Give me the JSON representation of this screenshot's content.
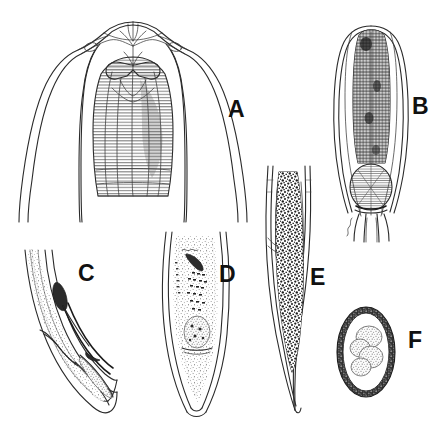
{
  "figure": {
    "kind": "scientific-line-drawing-plate",
    "background_color": "#ffffff",
    "ink_color": "#2a2a2a",
    "label_color": "#111111",
    "width": 445,
    "height": 437,
    "panel_count": 6
  },
  "panels": [
    {
      "id": "A",
      "label": "A",
      "label_x": 228,
      "label_y": 98,
      "description": "anterior end, en face / lateral view showing cephalic alae and striated esophagus",
      "box": {
        "x": 20,
        "y": 12,
        "width": 215,
        "height": 215
      }
    },
    {
      "id": "B",
      "label": "B",
      "label_x": 412,
      "label_y": 95,
      "description": "anterior end showing esophagus and terminal esophageal bulb",
      "box": {
        "x": 330,
        "y": 20,
        "width": 100,
        "height": 220
      }
    },
    {
      "id": "C",
      "label": "C",
      "label_x": 78,
      "label_y": 262,
      "description": "curved male tail with spicule",
      "box": {
        "x": 22,
        "y": 248,
        "width": 95,
        "height": 160
      }
    },
    {
      "id": "D",
      "label": "D",
      "label_x": 219,
      "label_y": 263,
      "description": "tail region, lateral view",
      "box": {
        "x": 158,
        "y": 228,
        "width": 90,
        "height": 185
      }
    },
    {
      "id": "E",
      "label": "E",
      "label_x": 310,
      "label_y": 266,
      "description": "pointed tail with granular intestinal contents",
      "box": {
        "x": 262,
        "y": 162,
        "width": 70,
        "height": 250
      }
    },
    {
      "id": "F",
      "label": "F",
      "label_x": 408,
      "label_y": 329,
      "description": "egg with thick mammillated shell containing blastomeres",
      "box": {
        "x": 336,
        "y": 302,
        "width": 70,
        "height": 105
      }
    }
  ]
}
